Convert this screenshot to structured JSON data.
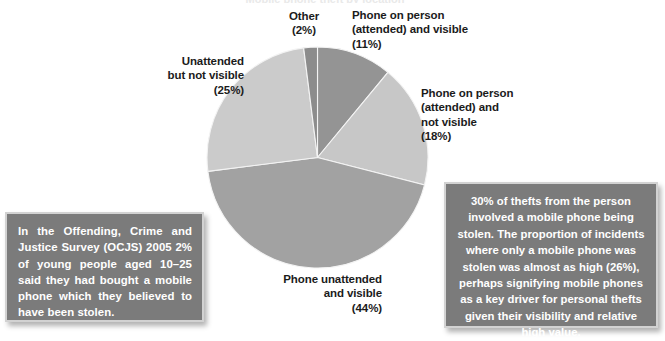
{
  "figure": {
    "clipped_title": "Mobile phone theft by location"
  },
  "chart_data": {
    "type": "pie",
    "title": "",
    "xlabel": "",
    "ylabel": "",
    "legend_position": "callout-labels",
    "grid": false,
    "unit": "%",
    "categories": [
      "Phone on person (attended) and visible",
      "Phone on person (attended) and not visible",
      "Phone unattended and visible",
      "Unattended but not visible",
      "Other"
    ],
    "values": [
      11,
      18,
      44,
      25,
      2
    ],
    "colors": [
      "#949494",
      "#c7c7c7",
      "#a2a2a2",
      "#cbcbcb",
      "#8c8c8c"
    ],
    "slices": [
      {
        "label": "Phone on person\n(attended) and visible",
        "value_label": "(11%)",
        "value": 11,
        "color": "#949494"
      },
      {
        "label": "Phone on person\n(attended) and\nnot visible",
        "value_label": "(18%)",
        "value": 18,
        "color": "#c7c7c7"
      },
      {
        "label": "Phone unattended\nand visible",
        "value_label": "(44%)",
        "value": 44,
        "color": "#a2a2a2"
      },
      {
        "label": "Unattended\nbut not visible",
        "value_label": "(25%)",
        "value": 25,
        "color": "#cbcbcb"
      },
      {
        "label": "Other",
        "value_label": "(2%)",
        "value": 2,
        "color": "#8c8c8c"
      }
    ]
  },
  "labels": {
    "other": "Other\n(2%)",
    "attended_visible": "Phone on person\n(attended) and visible\n  (11%)",
    "unattended_not_visible": "Unattended\nbut not visible\n(25%)",
    "attended_not_visible": "Phone on person\n(attended) and\nnot visible\n  (18%)",
    "unattended_visible": "Phone unattended\nand visible\n(44%)"
  },
  "callouts": {
    "left": "In the Offending, Crime and Justice Survey (OCJS) 2005 2% of young people aged 10–25 said they had bought a mobile phone which they believed to have been stolen.",
    "right": "30% of thefts from the person involved a mobile phone being stolen. The proportion of incidents where only a mobile phone was stolen was almost as high (26%), perhaps signifying mobile phones as a key driver for personal thefts given their visibility and relative high value."
  },
  "colors": {
    "callout_background": "#7b7b7b",
    "callout_border": "#d2d2d2",
    "callout_text": "#ffffff",
    "label_text": "#1b1b1b",
    "page_background": "#ffffff"
  }
}
